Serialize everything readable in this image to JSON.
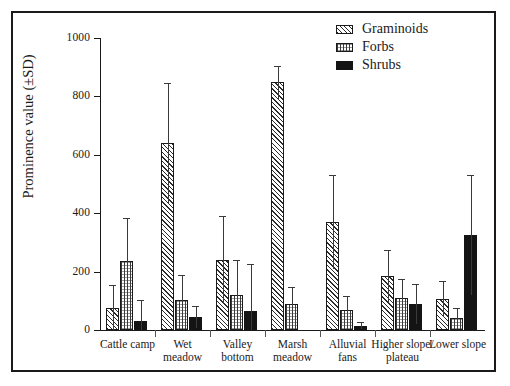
{
  "chart_data": {
    "type": "bar",
    "title": "",
    "xlabel": "",
    "ylabel": "Prominence value (±SD)",
    "ylim": [
      0,
      1000
    ],
    "yticks": [
      0,
      200,
      400,
      600,
      800,
      1000
    ],
    "grid": false,
    "legend_position": "top-right",
    "categories": [
      "Cattle camp",
      "Wet meadow",
      "Valley bottom",
      "Marsh meadow",
      "Alluvial fans",
      "Higher slope/ plateau",
      "Lower slope"
    ],
    "category_lines": [
      [
        "Cattle camp"
      ],
      [
        "Wet",
        "meadow"
      ],
      [
        "Valley",
        "bottom"
      ],
      [
        "Marsh",
        "meadow"
      ],
      [
        "Alluvial",
        "fans"
      ],
      [
        "Higher slope/",
        "plateau"
      ],
      [
        "Lower slope"
      ]
    ],
    "series": [
      {
        "name": "Graminoids",
        "pattern": "diagonal-hatch",
        "color": "#2b2b2b",
        "values": [
          75,
          640,
          240,
          848,
          370,
          185,
          105
        ],
        "errors": [
          80,
          205,
          150,
          57,
          162,
          90,
          62
        ]
      },
      {
        "name": "Forbs",
        "pattern": "cross-dot-hatch",
        "color": "#3a3a3a",
        "values": [
          235,
          102,
          120,
          88,
          70,
          110,
          40
        ],
        "errors": [
          150,
          88,
          120,
          60,
          45,
          65,
          35
        ]
      },
      {
        "name": "Shrubs",
        "pattern": "solid",
        "color": "#141414",
        "values": [
          32,
          45,
          65,
          0,
          15,
          90,
          325
        ],
        "errors": [
          72,
          38,
          160,
          0,
          12,
          68,
          205
        ]
      }
    ]
  },
  "legend": {
    "items": [
      {
        "label": "Graminoids",
        "swatch": "graminoids"
      },
      {
        "label": "Forbs",
        "swatch": "forbs"
      },
      {
        "label": "Shrubs",
        "swatch": "shrubs"
      }
    ]
  }
}
